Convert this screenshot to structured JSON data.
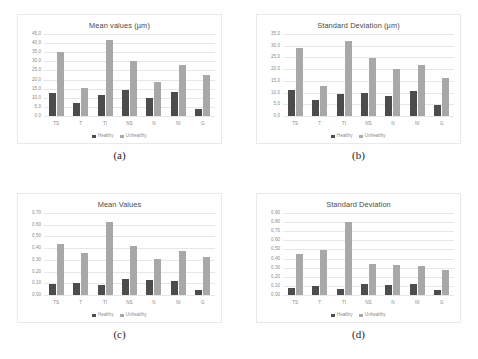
{
  "figure": {
    "legend": {
      "healthy": "Healthy",
      "unhealthy": "Unhealthy"
    },
    "colors": {
      "healthy": "#4c4c4c",
      "unhealthy": "#a8a8a8",
      "gridline": "#e4e8ee",
      "text": "#8a8a8a"
    },
    "captions": {
      "a": "(a)",
      "b": "(b)",
      "c": "(c)",
      "d": "(d)"
    }
  },
  "chart_data": [
    {
      "id": "a",
      "type": "bar",
      "title": "Mean values (µm)",
      "xlabel": "",
      "ylabel": "",
      "ylim": [
        0.0,
        45.0
      ],
      "ytick_step": 5.0,
      "ytick_labels": [
        "45,0",
        "40,0",
        "35,0",
        "30,0",
        "25,0",
        "20,0",
        "15,0",
        "10,0",
        "5,0",
        "0,0"
      ],
      "grid": true,
      "legend_position": "bottom",
      "categories": [
        "TS",
        "T",
        "TI",
        "NS",
        "N",
        "NI",
        "G"
      ],
      "series": [
        {
          "name": "Healthy",
          "values": [
            12.8,
            6.9,
            11.6,
            14.1,
            9.9,
            13.0,
            4.1
          ]
        },
        {
          "name": "Unhealthy",
          "values": [
            35.3,
            15.3,
            41.5,
            30.2,
            18.4,
            28.2,
            22.3
          ]
        }
      ]
    },
    {
      "id": "b",
      "type": "bar",
      "title": "Standard Deviation (µm)",
      "xlabel": "",
      "ylabel": "",
      "ylim": [
        0.0,
        35.0
      ],
      "ytick_step": 5.0,
      "ytick_labels": [
        "35,0",
        "30,0",
        "25,0",
        "20,0",
        "15,0",
        "10,0",
        "5,0",
        "0,0"
      ],
      "grid": true,
      "legend_position": "bottom",
      "categories": [
        "TS",
        "T",
        "TI",
        "NS",
        "N",
        "NI",
        "G"
      ],
      "series": [
        {
          "name": "Healthy",
          "values": [
            11.0,
            6.8,
            9.4,
            9.8,
            8.4,
            10.6,
            4.8
          ]
        },
        {
          "name": "Unhealthy",
          "values": [
            29.2,
            12.9,
            32.2,
            24.8,
            19.9,
            21.9,
            16.4
          ]
        }
      ]
    },
    {
      "id": "c",
      "type": "bar",
      "title": "Mean Values",
      "xlabel": "",
      "ylabel": "",
      "ylim": [
        0.0,
        0.7
      ],
      "ytick_step": 0.1,
      "ytick_labels": [
        "0,70",
        "0,60",
        "0,50",
        "0,40",
        "0,30",
        "0,20",
        "0,10",
        "0,00"
      ],
      "grid": true,
      "legend_position": "bottom",
      "categories": [
        "TS",
        "T",
        "TI",
        "NS",
        "N",
        "NI",
        "G"
      ],
      "series": [
        {
          "name": "Healthy",
          "values": [
            0.098,
            0.1,
            0.088,
            0.135,
            0.125,
            0.122,
            0.045
          ]
        },
        {
          "name": "Unhealthy",
          "values": [
            0.435,
            0.36,
            0.62,
            0.42,
            0.305,
            0.38,
            0.325
          ]
        }
      ]
    },
    {
      "id": "d",
      "type": "bar",
      "title": "Standard Deviation",
      "xlabel": "",
      "ylabel": "",
      "ylim": [
        0.0,
        0.9
      ],
      "ytick_step": 0.1,
      "ytick_labels": [
        "0,90",
        "0,80",
        "0,70",
        "0,60",
        "0,50",
        "0,40",
        "0,30",
        "0,20",
        "0,10",
        "0,00"
      ],
      "grid": true,
      "legend_position": "bottom",
      "categories": [
        "TS",
        "T",
        "TI",
        "NS",
        "N",
        "NI",
        "G"
      ],
      "series": [
        {
          "name": "Healthy",
          "values": [
            0.082,
            0.098,
            0.07,
            0.125,
            0.105,
            0.12,
            0.058
          ]
        },
        {
          "name": "Unhealthy",
          "values": [
            0.455,
            0.49,
            0.8,
            0.345,
            0.33,
            0.315,
            0.275
          ]
        }
      ]
    }
  ]
}
